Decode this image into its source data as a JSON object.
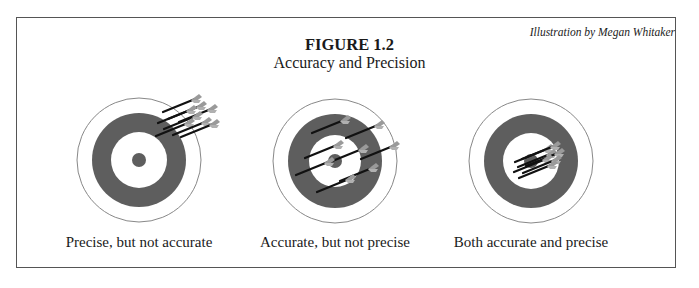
{
  "figure": {
    "credit": "Illustration by Megan Whitaker",
    "title": "FIGURE 1.2",
    "subtitle": "Accuracy and Precision"
  },
  "colors": {
    "ring": "#5e5e5e",
    "outline": "#888888",
    "arrow_shaft": "#111111",
    "fletching": "#9a9a9a"
  },
  "targets": [
    {
      "label": "Precise, but not accurate",
      "arrow_grouping": "clustered at upper-right edge"
    },
    {
      "label": "Accurate, but not precise",
      "arrow_grouping": "scattered around center"
    },
    {
      "label": "Both accurate and precise",
      "arrow_grouping": "clustered at bullseye"
    }
  ]
}
